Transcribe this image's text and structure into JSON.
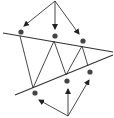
{
  "diagram": {
    "type": "line-triangle-dots-arrows",
    "colors": {
      "line": "#333333",
      "dot": "#444444",
      "background": "#ffffff"
    },
    "sources": [
      {
        "name": "top-source",
        "x": 55,
        "y": 1
      },
      {
        "name": "bottom-source",
        "x": 68,
        "y": 116
      }
    ],
    "upper_line": {
      "x1": 3,
      "y1": 33,
      "x2": 113,
      "y2": 52
    },
    "lower_line": {
      "x1": 15,
      "y1": 95,
      "x2": 113,
      "y2": 55
    },
    "upper_dots": [
      {
        "x": 21,
        "y": 32
      },
      {
        "x": 55,
        "y": 36
      },
      {
        "x": 83,
        "y": 41
      }
    ],
    "lower_dots": [
      {
        "x": 35,
        "y": 93
      },
      {
        "x": 67,
        "y": 81
      },
      {
        "x": 90,
        "y": 72
      }
    ],
    "zigzag": [
      {
        "x": 20,
        "y": 36
      },
      {
        "x": 33,
        "y": 88
      },
      {
        "x": 54,
        "y": 41
      },
      {
        "x": 66,
        "y": 75
      },
      {
        "x": 82,
        "y": 46
      },
      {
        "x": 88,
        "y": 66
      }
    ],
    "top_arrows": [
      {
        "x1": 55,
        "y1": 1,
        "x2": 24,
        "y2": 26
      },
      {
        "x1": 55,
        "y1": 1,
        "x2": 55,
        "y2": 29
      },
      {
        "x1": 55,
        "y1": 1,
        "x2": 79,
        "y2": 34
      }
    ],
    "bottom_arrows": [
      {
        "x1": 68,
        "y1": 116,
        "x2": 39,
        "y2": 100
      },
      {
        "x1": 68,
        "y1": 116,
        "x2": 68,
        "y2": 89
      },
      {
        "x1": 68,
        "y1": 116,
        "x2": 89,
        "y2": 80
      }
    ]
  }
}
